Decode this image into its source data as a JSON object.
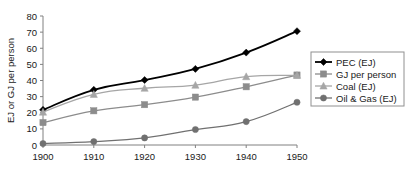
{
  "chart_data": {
    "type": "line",
    "title": "",
    "subtitle": "",
    "xlabel": "",
    "ylabel": "EJ or GJ per person",
    "x": [
      1900,
      1910,
      1920,
      1930,
      1940,
      1950
    ],
    "xtick_labels": [
      "1900",
      "1910",
      "1920",
      "1930",
      "1940",
      "1950"
    ],
    "ytick_labels": [
      "0",
      "10",
      "20",
      "30",
      "40",
      "50",
      "60",
      "70",
      "80"
    ],
    "ytick_values": [
      0,
      10,
      20,
      30,
      40,
      50,
      60,
      70,
      80
    ],
    "xlim": [
      1900,
      1950
    ],
    "ylim": [
      0,
      80
    ],
    "grid": false,
    "legend_position": "right",
    "series": [
      {
        "name": "PEC  (EJ)",
        "marker": "diamond",
        "color": "#000000",
        "line_width": 1.8,
        "values": [
          21.8,
          34.2,
          40.3,
          47.2,
          57.3,
          70.6
        ]
      },
      {
        "name": "GJ  per person",
        "marker": "square",
        "color": "#8c8c8c",
        "line_width": 1.3,
        "values": [
          13.9,
          21.2,
          25.0,
          29.7,
          36.1,
          43.4
        ]
      },
      {
        "name": "Coal (EJ)",
        "marker": "triangle",
        "color": "#a6a6a6",
        "line_width": 1.3,
        "values": [
          20.4,
          31.4,
          35.2,
          37.1,
          42.4,
          43.2
        ]
      },
      {
        "name": "Oil & Gas (EJ)",
        "marker": "circle",
        "color": "#707070",
        "line_width": 1.3,
        "values": [
          0.9,
          2.1,
          4.4,
          9.6,
          14.5,
          26.5
        ]
      }
    ]
  }
}
